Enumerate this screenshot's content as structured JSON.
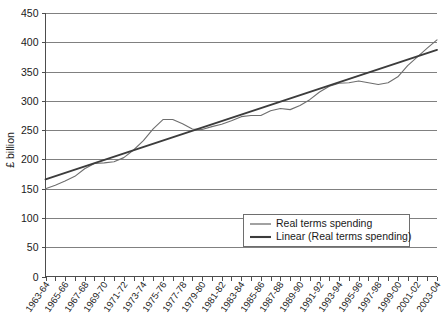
{
  "chart_data": {
    "type": "line",
    "title": "",
    "xlabel": "",
    "ylabel": "£ billion",
    "ylim": [
      0,
      450
    ],
    "ytick_step": 50,
    "yticks": [
      "0",
      "50",
      "100",
      "150",
      "200",
      "250",
      "300",
      "350",
      "400",
      "450"
    ],
    "grid": true,
    "legend_position": "inside-lower-right",
    "x": [
      "1963-64",
      "1964-65",
      "1965-66",
      "1966-67",
      "1967-68",
      "1968-69",
      "1969-70",
      "1970-71",
      "1971-72",
      "1972-73",
      "1973-74",
      "1974-75",
      "1975-76",
      "1976-77",
      "1977-78",
      "1978-79",
      "1979-80",
      "1980-81",
      "1981-82",
      "1982-83",
      "1983-84",
      "1984-85",
      "1985-86",
      "1986-87",
      "1987-88",
      "1988-89",
      "1989-90",
      "1990-91",
      "1991-92",
      "1992-93",
      "1993-94",
      "1994-95",
      "1995-96",
      "1996-97",
      "1997-98",
      "1998-99",
      "1999-00",
      "2000-01",
      "2001-02",
      "2002-03",
      "2003-04"
    ],
    "xtick_labels": [
      "1963-64",
      "1965-66",
      "1967-68",
      "1969-70",
      "1971-72",
      "1973-74",
      "1975-76",
      "1977-78",
      "1979-80",
      "1981-82",
      "1983-84",
      "1985-86",
      "1987-88",
      "1989-90",
      "1991-92",
      "1993-94",
      "1995-96",
      "1997-98",
      "1999-00",
      "2001-02",
      "2003-04"
    ],
    "series": [
      {
        "name": "Real terms spending",
        "color": "#6e6e6e",
        "values": [
          150,
          156,
          163,
          171,
          184,
          193,
          194,
          196,
          203,
          216,
          232,
          252,
          268,
          268,
          261,
          252,
          251,
          256,
          260,
          266,
          273,
          275,
          275,
          283,
          287,
          285,
          292,
          302,
          315,
          325,
          330,
          331,
          334,
          331,
          328,
          331,
          341,
          360,
          375,
          390,
          404
        ]
      },
      {
        "name": "Linear (Real terms spending)",
        "color": "#3c3c3c",
        "type": "trend",
        "endpoints": [
          166,
          387
        ]
      }
    ],
    "legend": [
      "Real terms spending",
      "Linear (Real terms spending)"
    ]
  }
}
